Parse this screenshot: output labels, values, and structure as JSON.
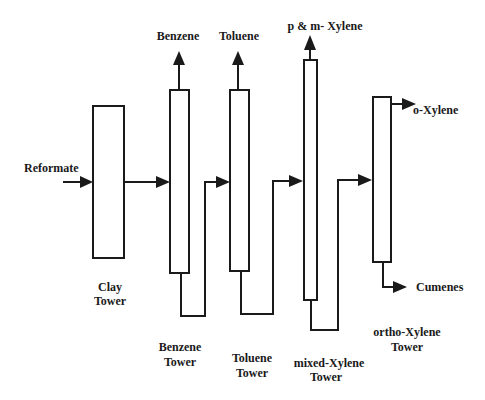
{
  "diagram": {
    "title": "",
    "feed": {
      "label": "Reformate"
    },
    "towers": [
      {
        "id": "clay",
        "label_line1": "Clay",
        "label_line2": "Tower"
      },
      {
        "id": "benzene",
        "label_line1": "Benzene",
        "label_line2": "Tower"
      },
      {
        "id": "toluene",
        "label_line1": "Toluene",
        "label_line2": "Tower"
      },
      {
        "id": "mixed-xylene",
        "label_line1": "mixed-Xylene",
        "label_line2": "Tower"
      },
      {
        "id": "ortho-xylene",
        "label_line1": "ortho-Xylene",
        "label_line2": "Tower"
      }
    ],
    "products": {
      "benzene": "Benzene",
      "toluene": "Toluene",
      "pm_xylene": "p & m- Xylene",
      "o_xylene": "o-Xylene",
      "cumenes": "Cumenes"
    },
    "colors": {
      "stroke": "#1a1a1a",
      "background": "#ffffff"
    }
  }
}
